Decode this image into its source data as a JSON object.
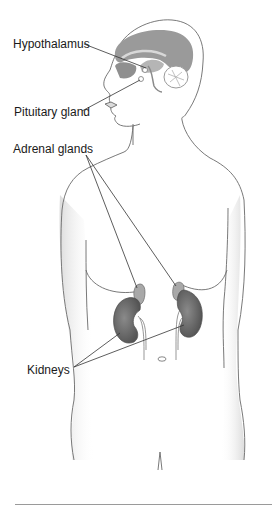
{
  "figure": {
    "labels": [
      {
        "id": "hypothalamus",
        "text": "Hypothalamus",
        "x": 13,
        "y": 37
      },
      {
        "id": "pituitary",
        "text": "Pituitary gland",
        "x": 14,
        "y": 105
      },
      {
        "id": "adrenal",
        "text": "Adrenal glands",
        "x": 13,
        "y": 142
      },
      {
        "id": "kidneys",
        "text": "Kidneys",
        "x": 27,
        "y": 363
      }
    ],
    "leader_lines": [
      {
        "label": "hypothalamus",
        "from": [
          84,
          44
        ],
        "to": [
          146,
          68
        ]
      },
      {
        "label": "pituitary",
        "from": [
          82,
          111
        ],
        "to": [
          140,
          80
        ]
      },
      {
        "label": "adrenal",
        "from": [
          86,
          155
        ],
        "to": [
          135,
          287
        ]
      },
      {
        "label": "adrenal",
        "from": [
          86,
          155
        ],
        "to": [
          175,
          285
        ]
      },
      {
        "label": "kidneys",
        "from": [
          74,
          367
        ],
        "to": [
          120,
          333
        ]
      },
      {
        "label": "kidneys",
        "from": [
          74,
          367
        ],
        "to": [
          185,
          325
        ]
      }
    ]
  },
  "colors": {
    "outline": "#6a6a6a",
    "brain": "#9a9a9a",
    "brain_light": "#c8c8c8",
    "kidney": "#6e6e6e",
    "kidney_dark": "#4e4e4e",
    "adrenal": "#a8a8a8",
    "shading": "#e2e2e2",
    "leader": "#333333",
    "text": "#1a1a1a"
  }
}
